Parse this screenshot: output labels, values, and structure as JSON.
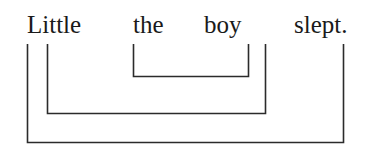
{
  "figure": {
    "type": "syntactic-bracketing-diagram",
    "canvas": {
      "width": 379,
      "height": 158,
      "background": "#ffffff"
    },
    "ink_color": "#2b2b2b",
    "text_color": "#1a1a1a"
  },
  "sentence": {
    "full_text": "Little the boy slept.",
    "words": [
      {
        "id": "w1",
        "text": "Little",
        "x": 27,
        "y": 12
      },
      {
        "id": "w2",
        "text": "the",
        "x": 133,
        "y": 12
      },
      {
        "id": "w3",
        "text": "boy",
        "x": 204,
        "y": 12
      },
      {
        "id": "w4",
        "text": "slept.",
        "x": 294,
        "y": 12
      }
    ]
  },
  "brackets": [
    {
      "id": "b1",
      "label": "inner-bracket-the-boy",
      "spans": "the boy",
      "left_x": 133,
      "right_x": 248,
      "top_y": 44,
      "bottom_y": 76
    },
    {
      "id": "b2",
      "label": "middle-bracket-little-the-boy",
      "spans": "Little the boy",
      "left_x": 47,
      "right_x": 265,
      "top_y": 44,
      "bottom_y": 113
    },
    {
      "id": "b3",
      "label": "outer-bracket-whole-sentence",
      "spans": "Little the boy slept.",
      "left_x": 27,
      "right_x": 343,
      "top_y": 44,
      "bottom_y": 142
    }
  ]
}
